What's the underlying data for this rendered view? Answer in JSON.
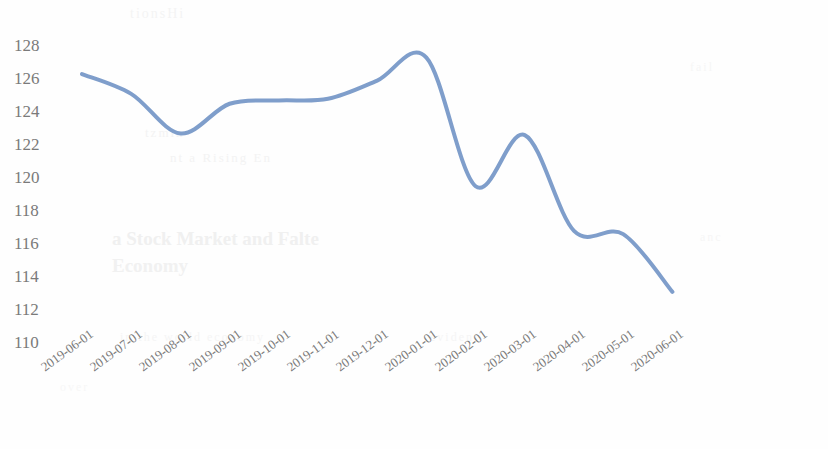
{
  "chart_data": {
    "type": "line",
    "title": "",
    "subtitle": "",
    "xlabel": "",
    "ylabel": "",
    "categories": [
      "2019-06-01",
      "2019-07-01",
      "2019-08-01",
      "2019-09-01",
      "2019-10-01",
      "2019-11-01",
      "2019-12-01",
      "2020-01-01",
      "2020-02-01",
      "2020-03-01",
      "2020-04-01",
      "2020-05-01",
      "2020-06-01"
    ],
    "values": [
      126.3,
      125.1,
      122.7,
      124.5,
      124.7,
      124.8,
      125.9,
      127.3,
      119.5,
      122.6,
      116.8,
      116.6,
      113.1
    ],
    "series": [
      {
        "name": "",
        "values": [
          126.3,
          125.1,
          122.7,
          124.5,
          124.7,
          124.8,
          125.9,
          127.3,
          119.5,
          122.6,
          116.8,
          116.6,
          113.1
        ]
      }
    ],
    "ylim": [
      110,
      128
    ],
    "ytick_labels": [
      "128",
      "126",
      "124",
      "122",
      "120",
      "118",
      "116",
      "114",
      "112",
      "110"
    ],
    "ytick_values": [
      128,
      126,
      124,
      122,
      120,
      118,
      116,
      114,
      112,
      110
    ],
    "xtick_labels": [
      "2019-06-01",
      "2019-07-01",
      "2019-08-01",
      "2019-09-01",
      "2019-10-01",
      "2019-11-01",
      "2019-12-01",
      "2020-01-01",
      "2020-02-01",
      "2020-03-01",
      "2020-04-01",
      "2020-05-01",
      "2020-06-01"
    ],
    "grid": false,
    "legend": "none",
    "smoothing": "spline",
    "line_color": "#7f9ecb",
    "line_width": 4,
    "markers": false,
    "axis_lines": false,
    "background_color": "#ffffff",
    "tick_label_color": "#7a7a7a",
    "xtick_rotation_degrees": -36
  },
  "background_bleed": {
    "line_1": "tionsHi",
    "line_2": "tzmin",
    "line_3": "nt a Rising En",
    "line_4": "a Stock Market and Falte",
    "line_5": "Economy",
    "line_6": "in the world economy",
    "line_7": "evident",
    "line_8": "fail",
    "line_9": "anc",
    "line_10": "over"
  }
}
